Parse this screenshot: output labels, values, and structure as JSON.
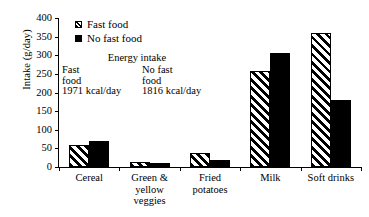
{
  "chart_data": {
    "type": "bar",
    "title": "",
    "xlabel": "",
    "ylabel": "Intake (g/day)",
    "ylim": [
      0,
      400
    ],
    "yticks": [
      0,
      50,
      100,
      150,
      200,
      250,
      300,
      350,
      400
    ],
    "grid": false,
    "legend_position": "top-left-inside",
    "categories": [
      "Cereal",
      "Green &\nyellow\nveggies",
      "Fried\npotatoes",
      "Milk",
      "Soft drinks"
    ],
    "series": [
      {
        "name": "Fast food",
        "values": [
          60,
          13,
          38,
          258,
          360
        ]
      },
      {
        "name": "No fast food",
        "values": [
          70,
          12,
          20,
          305,
          180
        ]
      }
    ],
    "annotations": {
      "title": "Energy intake",
      "columns": [
        {
          "label_line1": "Fast",
          "label_line2": "food",
          "value": "1971 kcal/day"
        },
        {
          "label_line1": "No fast",
          "label_line2": "food",
          "value": "1816 kcal/day"
        }
      ]
    }
  },
  "categories_display": [
    [
      "Cereal"
    ],
    [
      "Green &",
      "yellow",
      "veggies"
    ],
    [
      "Fried",
      "potatoes"
    ],
    [
      "Milk"
    ],
    [
      "Soft drinks"
    ]
  ],
  "legend": {
    "items": [
      {
        "label": "Fast food",
        "pattern": "diagonal-hatch"
      },
      {
        "label": "No fast food",
        "pattern": "solid-black"
      }
    ]
  },
  "colors": {
    "foreground": "#000000",
    "background": "#ffffff"
  }
}
